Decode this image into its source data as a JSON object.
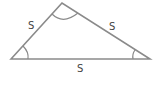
{
  "diagram": {
    "type": "triangle",
    "vertices": {
      "left": [
        11,
        59
      ],
      "top": [
        62,
        3
      ],
      "right": [
        150,
        59
      ]
    },
    "labels": {
      "left_side": "S",
      "right_side": "S",
      "base": "S"
    },
    "colors": {
      "stroke": "#8a8a8a",
      "label": "#444444"
    }
  }
}
